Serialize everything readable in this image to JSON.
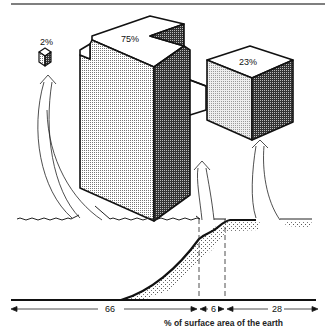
{
  "diagram": {
    "blocks": {
      "ice_block_label": "2%",
      "ocean_block_label": "75%",
      "land_block_label": "23%"
    },
    "scale": {
      "segments": [
        {
          "value": "66"
        },
        {
          "value": "6"
        },
        {
          "value": "28"
        }
      ],
      "caption": "% of surface area of the earth"
    },
    "colors": {
      "ink": "#111111",
      "light_face": "#d8d8d8",
      "dark_face": "#5a5a5a",
      "background": "#ffffff"
    }
  }
}
